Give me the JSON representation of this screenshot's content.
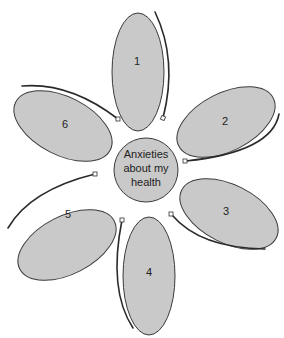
{
  "diagram": {
    "center": {
      "lines": [
        "Anxieties",
        "about my",
        "health"
      ]
    },
    "petals": [
      {
        "label": "1"
      },
      {
        "label": "2"
      },
      {
        "label": "3"
      },
      {
        "label": "4"
      },
      {
        "label": "5"
      },
      {
        "label": "6"
      }
    ],
    "colors": {
      "petal_fill": "#c9c9c9",
      "outline": "#3a3a3a",
      "background": "#ffffff"
    }
  }
}
